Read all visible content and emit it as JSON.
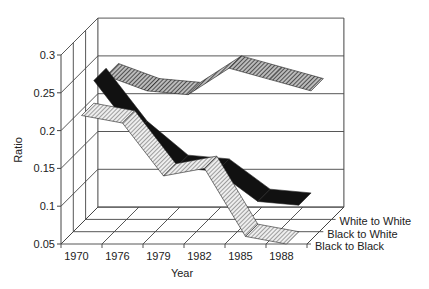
{
  "chart_data": {
    "type": "area",
    "subtype": "3d-ribbon-line",
    "title": "",
    "xlabel": "Year",
    "ylabel": "Ratio",
    "categories": [
      "1970",
      "1976",
      "1979",
      "1982",
      "1985",
      "1988"
    ],
    "ylim": [
      0.05,
      0.3
    ],
    "yticks": [
      "0.05",
      "0.1",
      "0.15",
      "0.2",
      "0.25",
      "0.3"
    ],
    "grid": true,
    "legend_position": "depth-axis-right",
    "series": [
      {
        "name": "White to White",
        "values": [
          0.24,
          0.22,
          0.215,
          0.25,
          0.235,
          0.22
        ],
        "fill": "dark-hatch"
      },
      {
        "name": "Black to White",
        "values": [
          0.25,
          0.18,
          0.135,
          0.13,
          0.09,
          0.085
        ],
        "fill": "solid-black"
      },
      {
        "name": "Black to Black",
        "values": [
          0.22,
          0.21,
          0.14,
          0.15,
          0.06,
          0.05
        ],
        "fill": "light-hatch"
      }
    ]
  },
  "colors": {
    "axis": "#333333",
    "grid": "#555555",
    "black": "#111111",
    "hatch_dark": "#555555",
    "hatch_light": "#888888"
  }
}
